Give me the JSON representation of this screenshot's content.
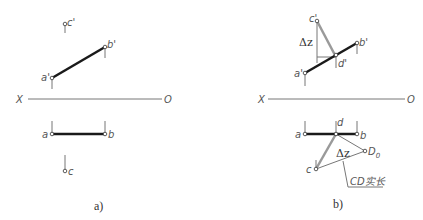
{
  "figure_a": {
    "caption": "a)",
    "axis": {
      "left_label": "X",
      "right_label": "O"
    },
    "points": {
      "a_prime": "a'",
      "b_prime": "b'",
      "c_prime": "c'",
      "a": "a",
      "b": "b",
      "c": "c"
    }
  },
  "figure_b": {
    "caption": "b)",
    "axis": {
      "left_label": "X",
      "right_label": "O"
    },
    "points": {
      "a_prime": "a'",
      "b_prime": "b'",
      "c_prime": "c'",
      "d_prime": "d'",
      "a": "a",
      "b": "b",
      "c": "c",
      "d": "d",
      "D0": "D",
      "D0_sub": "0"
    },
    "delta_z_front": "Δz",
    "delta_z_top": "Δz",
    "true_length_label": "CD实长"
  },
  "colors": {
    "thick_line": "#1a1a1a",
    "thin_line": "#777777",
    "gray_line": "#9a9a9a"
  }
}
